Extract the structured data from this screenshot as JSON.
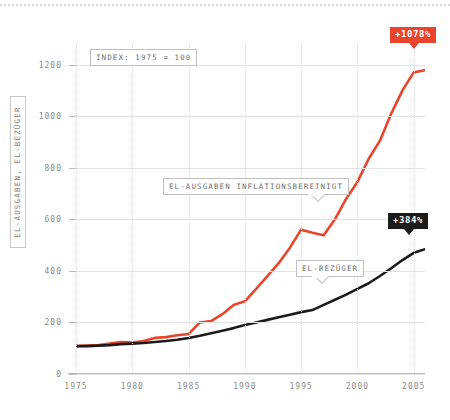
{
  "chart_data": {
    "type": "line",
    "title": "",
    "xlabel": "",
    "ylabel": "EL-AUSGABEN, EL-BEZÜGER",
    "note": "INDEX: 1975 = 100",
    "xlim": [
      1975,
      2006
    ],
    "ylim": [
      0,
      1280
    ],
    "grid": "horizontal solid gridlines at y majors; vertical dotted gridlines at 5-year x majors",
    "legend": "inline annotations labelling each series",
    "x_ticks": [
      "1975",
      "1980",
      "1985",
      "1990",
      "1995",
      "2000",
      "2005"
    ],
    "x_tick_values": [
      1975,
      1980,
      1985,
      1990,
      1995,
      2000,
      2005
    ],
    "y_ticks": [
      "0",
      "200",
      "400",
      "600",
      "800",
      "1000",
      "1200"
    ],
    "y_tick_values": [
      0,
      200,
      400,
      600,
      800,
      1000,
      1200
    ],
    "x": [
      1975,
      1976,
      1977,
      1978,
      1979,
      1980,
      1981,
      1982,
      1983,
      1984,
      1985,
      1986,
      1987,
      1988,
      1989,
      1990,
      1991,
      1992,
      1993,
      1994,
      1995,
      1996,
      1997,
      1998,
      1999,
      2000,
      2001,
      2002,
      2003,
      2004,
      2005,
      2006
    ],
    "series": [
      {
        "name": "EL-AUSGABEN INFLATIONSBEREINIGT",
        "color": "#e8452c",
        "end_label": "+1078%",
        "values": [
          108,
          110,
          112,
          118,
          124,
          122,
          128,
          140,
          143,
          150,
          155,
          200,
          205,
          232,
          268,
          282,
          330,
          380,
          430,
          490,
          560,
          548,
          538,
          600,
          680,
          745,
          835,
          905,
          1010,
          1100,
          1170,
          1178
        ]
      },
      {
        "name": "EL-BEZÜGER",
        "color": "#1c1c1c",
        "end_label": "+384%",
        "values": [
          108,
          108,
          110,
          112,
          116,
          118,
          120,
          124,
          128,
          133,
          140,
          148,
          158,
          168,
          178,
          190,
          200,
          210,
          220,
          230,
          240,
          248,
          268,
          288,
          308,
          330,
          352,
          380,
          410,
          442,
          470,
          484
        ]
      }
    ],
    "annotations": [
      {
        "text": "INDEX: 1975 = 100",
        "kind": "note-box"
      },
      {
        "text": "EL-AUSGABEN INFLATIONSBEREINIGT",
        "kind": "series-callout"
      },
      {
        "text": "EL-BEZÜGER",
        "kind": "series-callout"
      },
      {
        "text": "+1078%",
        "kind": "end-badge",
        "color": "#e8452c"
      },
      {
        "text": "+384%",
        "kind": "end-badge",
        "color": "#1c1c1c"
      }
    ]
  },
  "colors": {
    "accent_red": "#e8452c",
    "accent_black": "#1c1c1c",
    "grid": "#e3e3e3",
    "grid_dotted": "#dcdcdc",
    "axis": "#b9b9b9",
    "tick_text": "#8a8a8a",
    "annot_text": "#6f6f6f"
  }
}
